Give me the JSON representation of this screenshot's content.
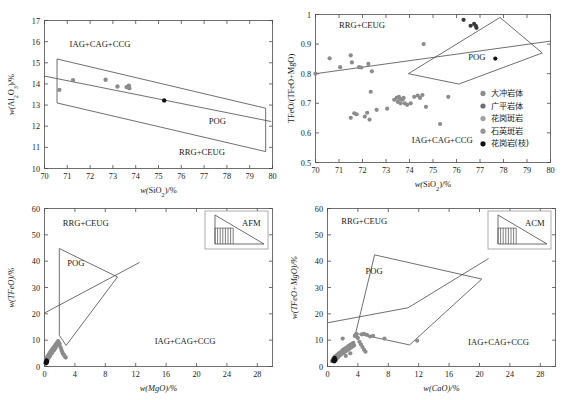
{
  "figure": {
    "panels": [
      "top-left",
      "top-right",
      "bottom-left",
      "bottom-right"
    ]
  },
  "legend": {
    "items": [
      {
        "label": "大冲岩体",
        "color": "#8c8c8c"
      },
      {
        "label": "广平岩体",
        "color": "#6e6e6e"
      },
      {
        "label": "花岗斑岩",
        "color": "#a0a0a0"
      },
      {
        "label": "石英斑岩",
        "color": "#949494"
      },
      {
        "label": "花岗岩(枝)",
        "color": "#111111"
      }
    ]
  },
  "chart_data": [
    {
      "id": "panel-a",
      "type": "scatter",
      "title": "",
      "xlabel": "w(SiO2)/%",
      "ylabel": "w(Al2O3)/%",
      "xlim": [
        70,
        80
      ],
      "ylim": [
        10,
        17
      ],
      "xticks": [
        70,
        71,
        72,
        73,
        74,
        75,
        76,
        77,
        78,
        79,
        80
      ],
      "yticks": [
        10,
        11,
        12,
        13,
        14,
        15,
        16,
        17
      ],
      "grid": false,
      "annotations": [
        {
          "text": "IAG+CAG+CCG",
          "x": 71.1,
          "y": 15.75
        },
        {
          "text": "POG",
          "x": 77.2,
          "y": 12.1
        },
        {
          "text": "RRG+CEUG",
          "x": 75.9,
          "y": 10.65
        }
      ],
      "fields": [
        {
          "name": "upper-boundary",
          "points": [
            [
              70.55,
              13.1
            ],
            [
              70.55,
              15.18
            ],
            [
              79.7,
              12.85
            ],
            [
              79.7,
              10.8
            ],
            [
              70.55,
              13.1
            ]
          ]
        },
        {
          "name": "mid-line",
          "points": [
            [
              70.0,
              14.37
            ],
            [
              79.95,
              12.22
            ]
          ]
        }
      ],
      "series": [
        {
          "name": "大冲岩体",
          "color": "#8c8c8c",
          "points": [
            [
              70.65,
              13.72
            ],
            [
              71.25,
              14.18
            ],
            [
              72.68,
              14.2
            ],
            [
              73.2,
              13.88
            ],
            [
              73.6,
              13.85
            ],
            [
              73.7,
              13.92
            ],
            [
              73.72,
              13.8
            ]
          ]
        },
        {
          "name": "花岗岩(枝)",
          "color": "#111111",
          "points": [
            [
              75.25,
              13.22
            ]
          ]
        }
      ]
    },
    {
      "id": "panel-b",
      "type": "scatter",
      "title": "",
      "xlabel": "w(SiO2)/%",
      "ylabel": "TFeO/(TFeO+MgO)",
      "xlim": [
        70,
        80
      ],
      "ylim": [
        0.5,
        1.0
      ],
      "xticks": [
        70,
        71,
        72,
        73,
        74,
        75,
        76,
        77,
        78,
        79,
        80
      ],
      "yticks": [
        0.5,
        0.6,
        0.7,
        0.8,
        0.9,
        1.0
      ],
      "grid": false,
      "annotations": [
        {
          "text": "RRG+CEUG",
          "x": 71.0,
          "y": 0.955
        },
        {
          "text": "POG",
          "x": 76.5,
          "y": 0.845
        },
        {
          "text": "IAG+CAG+CCG",
          "x": 74.1,
          "y": 0.565
        }
      ],
      "fields": [
        {
          "name": "pog-polygon",
          "points": [
            [
              73.95,
              0.8
            ],
            [
              77.85,
              0.99
            ],
            [
              79.65,
              0.87
            ],
            [
              76.1,
              0.765
            ],
            [
              73.95,
              0.8
            ]
          ]
        },
        {
          "name": "divider-line",
          "points": [
            [
              70.0,
              0.8
            ],
            [
              80.0,
              0.91
            ]
          ]
        }
      ],
      "series": [
        {
          "name": "大冲岩体",
          "color": "#8c8c8c",
          "points": [
            [
              70.0,
              0.8
            ],
            [
              70.6,
              0.852
            ],
            [
              71.05,
              0.822
            ],
            [
              71.5,
              0.862
            ],
            [
              71.55,
              0.838
            ],
            [
              71.85,
              0.822
            ],
            [
              71.95,
              0.821
            ],
            [
              72.25,
              0.833
            ],
            [
              72.4,
              0.808
            ],
            [
              71.5,
              0.651
            ],
            [
              71.65,
              0.666
            ],
            [
              71.75,
              0.663
            ],
            [
              72.1,
              0.655
            ],
            [
              72.2,
              0.668
            ],
            [
              72.3,
              0.645
            ],
            [
              72.35,
              0.739
            ],
            [
              72.6,
              0.678
            ],
            [
              73.05,
              0.682
            ],
            [
              73.35,
              0.712
            ],
            [
              73.45,
              0.718
            ],
            [
              73.5,
              0.705
            ],
            [
              73.55,
              0.722
            ],
            [
              73.6,
              0.715
            ],
            [
              73.62,
              0.7
            ],
            [
              73.7,
              0.712
            ],
            [
              73.75,
              0.718
            ],
            [
              73.8,
              0.7
            ],
            [
              73.9,
              0.695
            ],
            [
              74.05,
              0.7
            ],
            [
              74.2,
              0.722
            ],
            [
              74.35,
              0.726
            ],
            [
              74.45,
              0.718
            ],
            [
              74.55,
              0.728
            ],
            [
              74.6,
              0.9
            ],
            [
              74.7,
              0.688
            ],
            [
              75.3,
              0.63
            ],
            [
              75.65,
              0.722
            ]
          ]
        },
        {
          "name": "广平岩体",
          "color": "#3a3a3a",
          "points": [
            [
              76.3,
              0.982
            ],
            [
              76.6,
              0.962
            ],
            [
              76.75,
              0.968
            ],
            [
              76.82,
              0.962
            ],
            [
              76.85,
              0.955
            ]
          ]
        },
        {
          "name": "花岗岩(枝)",
          "color": "#111111",
          "points": [
            [
              77.65,
              0.851
            ]
          ]
        }
      ]
    },
    {
      "id": "panel-c",
      "type": "scatter",
      "title": "",
      "xlabel": "w(MgO)/%",
      "ylabel": "w(TFeO)/%",
      "xlim": [
        0,
        30
      ],
      "ylim": [
        0,
        60
      ],
      "xticks": [
        0,
        4,
        8,
        12,
        16,
        20,
        24,
        28
      ],
      "yticks": [
        0,
        10,
        20,
        30,
        40,
        50,
        60
      ],
      "grid": false,
      "inset": {
        "label": "AFM"
      },
      "annotations": [
        {
          "text": "RRG+CEUG",
          "x": 2.4,
          "y": 53.5
        },
        {
          "text": "POG",
          "x": 3.0,
          "y": 38.0
        },
        {
          "text": "IAG+CAG+CCG",
          "x": 14.5,
          "y": 8.5
        }
      ],
      "fields": [
        {
          "name": "pog-polygon",
          "points": [
            [
              1.95,
              11.8
            ],
            [
              1.95,
              44.8
            ],
            [
              9.6,
              34.0
            ],
            [
              2.85,
              8.0
            ],
            [
              1.95,
              11.8
            ]
          ]
        },
        {
          "name": "divider-line",
          "points": [
            [
              0.0,
              20.3
            ],
            [
              12.5,
              39.5
            ]
          ]
        }
      ],
      "series": [
        {
          "name": "大冲岩体",
          "color": "#8c8c8c",
          "points": [
            [
              0.12,
              1.2
            ],
            [
              0.15,
              1.6
            ],
            [
              0.18,
              2.0
            ],
            [
              0.2,
              2.4
            ],
            [
              0.22,
              1.1
            ],
            [
              0.25,
              2.8
            ],
            [
              0.28,
              1.5
            ],
            [
              0.3,
              3.2
            ],
            [
              0.32,
              2.1
            ],
            [
              0.35,
              3.6
            ],
            [
              0.4,
              2.5
            ],
            [
              0.45,
              4.0
            ],
            [
              0.5,
              3.0
            ],
            [
              0.55,
              4.4
            ],
            [
              0.6,
              3.5
            ],
            [
              0.65,
              4.8
            ],
            [
              0.7,
              5.2
            ],
            [
              0.75,
              4.1
            ],
            [
              0.8,
              5.6
            ],
            [
              0.9,
              6.0
            ],
            [
              0.95,
              5.0
            ],
            [
              1.0,
              6.4
            ],
            [
              1.05,
              5.5
            ],
            [
              1.1,
              6.8
            ],
            [
              1.2,
              7.2
            ],
            [
              1.25,
              6.2
            ],
            [
              1.3,
              7.6
            ],
            [
              1.4,
              8.0
            ],
            [
              1.45,
              7.0
            ],
            [
              1.5,
              8.4
            ],
            [
              1.55,
              7.8
            ],
            [
              1.6,
              8.8
            ],
            [
              1.7,
              9.2
            ],
            [
              1.75,
              8.2
            ],
            [
              1.8,
              9.6
            ],
            [
              1.9,
              9.0
            ],
            [
              2.0,
              8.6
            ],
            [
              2.1,
              7.4
            ],
            [
              2.2,
              6.6
            ],
            [
              2.3,
              5.8
            ],
            [
              2.4,
              5.0
            ],
            [
              2.5,
              4.6
            ],
            [
              2.6,
              4.2
            ],
            [
              2.7,
              3.8
            ],
            [
              2.8,
              3.4
            ],
            [
              1.15,
              6.9
            ],
            [
              0.85,
              5.3
            ],
            [
              0.58,
              4.2
            ],
            [
              0.42,
              3.3
            ],
            [
              0.26,
              2.2
            ]
          ]
        },
        {
          "name": "花岗岩(枝)",
          "color": "#111111",
          "points": [
            [
              0.18,
              1.3
            ],
            [
              0.22,
              1.8
            ],
            [
              0.26,
              2.3
            ],
            [
              0.3,
              1.5
            ],
            [
              0.34,
              2.0
            ]
          ]
        }
      ]
    },
    {
      "id": "panel-d",
      "type": "scatter",
      "title": "",
      "xlabel": "w(CaO)/%",
      "ylabel": "w(TFeO+MgO)/%",
      "xlim": [
        0,
        30
      ],
      "ylim": [
        0,
        60
      ],
      "xticks": [
        0,
        4,
        8,
        12,
        16,
        20,
        24,
        28
      ],
      "yticks": [
        0,
        10,
        20,
        30,
        40,
        50,
        60
      ],
      "grid": false,
      "inset": {
        "label": "ACM"
      },
      "annotations": [
        {
          "text": "RRG+CEUG",
          "x": 1.8,
          "y": 54.0
        },
        {
          "text": "POG",
          "x": 5.0,
          "y": 35.0
        },
        {
          "text": "IAG+CAG+CCG",
          "x": 18.5,
          "y": 8.0
        }
      ],
      "fields": [
        {
          "name": "pog-polygon",
          "points": [
            [
              3.7,
              12.6
            ],
            [
              6.2,
              42.4
            ],
            [
              20.3,
              33.2
            ],
            [
              10.8,
              8.2
            ],
            [
              3.7,
              12.6
            ]
          ]
        },
        {
          "name": "divider-line",
          "points": [
            [
              0.0,
              16.6
            ],
            [
              10.6,
              22.3
            ],
            [
              21.2,
              41.0
            ]
          ]
        }
      ],
      "series": [
        {
          "name": "大冲岩体",
          "color": "#8c8c8c",
          "points": [
            [
              0.6,
              2.0
            ],
            [
              0.7,
              2.6
            ],
            [
              0.8,
              3.1
            ],
            [
              0.9,
              3.6
            ],
            [
              1.0,
              2.2
            ],
            [
              1.1,
              4.0
            ],
            [
              1.2,
              3.0
            ],
            [
              1.3,
              4.5
            ],
            [
              1.4,
              3.5
            ],
            [
              1.5,
              5.0
            ],
            [
              1.6,
              4.2
            ],
            [
              1.7,
              5.4
            ],
            [
              1.8,
              4.6
            ],
            [
              1.9,
              5.8
            ],
            [
              2.0,
              6.2
            ],
            [
              2.1,
              5.2
            ],
            [
              2.2,
              6.6
            ],
            [
              2.3,
              5.6
            ],
            [
              2.4,
              7.0
            ],
            [
              2.5,
              6.0
            ],
            [
              2.6,
              7.4
            ],
            [
              2.7,
              6.4
            ],
            [
              2.8,
              7.8
            ],
            [
              2.9,
              6.8
            ],
            [
              3.0,
              8.2
            ],
            [
              3.1,
              7.2
            ],
            [
              3.2,
              8.6
            ],
            [
              3.3,
              7.6
            ],
            [
              3.4,
              9.0
            ],
            [
              3.5,
              8.0
            ],
            [
              3.6,
              11.6
            ],
            [
              3.7,
              12.0
            ],
            [
              3.8,
              12.4
            ],
            [
              3.9,
              11.2
            ],
            [
              4.0,
              10.8
            ],
            [
              4.2,
              9.4
            ],
            [
              4.4,
              8.4
            ],
            [
              4.6,
              7.4
            ],
            [
              4.8,
              6.4
            ],
            [
              5.0,
              5.6
            ],
            [
              4.5,
              12.2
            ],
            [
              4.8,
              12.4
            ],
            [
              5.2,
              12.0
            ],
            [
              5.6,
              11.4
            ],
            [
              6.0,
              11.6
            ],
            [
              2.0,
              10.6
            ],
            [
              7.5,
              10.6
            ],
            [
              11.8,
              9.8
            ],
            [
              3.0,
              5.0
            ],
            [
              2.4,
              4.0
            ]
          ]
        },
        {
          "name": "花岗岩(枝)",
          "color": "#111111",
          "points": [
            [
              0.75,
              2.2
            ],
            [
              0.85,
              2.8
            ],
            [
              0.95,
              3.3
            ],
            [
              1.05,
              2.5
            ],
            [
              0.9,
              1.9
            ]
          ]
        }
      ]
    }
  ]
}
